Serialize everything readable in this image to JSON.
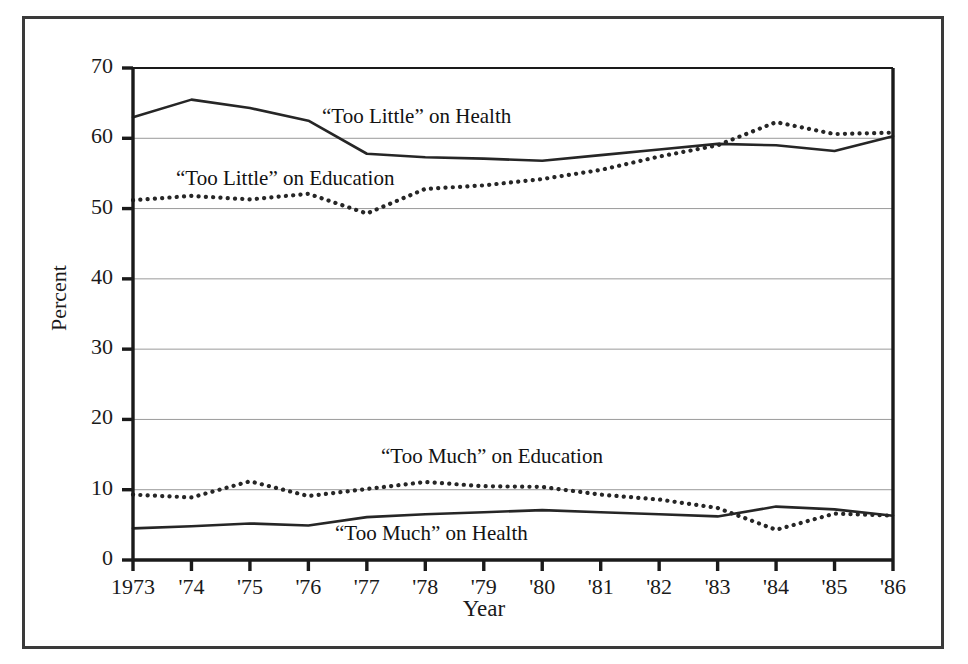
{
  "figure": {
    "background_color": "#ffffff",
    "frame_color": "#3a3a3a",
    "axis_color": "#1a1a1a",
    "gridline_color": "#9a9a9a",
    "series_color": "#262626"
  },
  "axes": {
    "x_title": "Year",
    "y_title": "Percent",
    "y_ticks": [
      "70",
      "60",
      "50",
      "40",
      "30",
      "20",
      "10",
      "0"
    ],
    "x_ticks": [
      "1973",
      "'74",
      "'75",
      "'76",
      "'77",
      "'78",
      "'79",
      "'80",
      "'81",
      "'82",
      "'83",
      "'84",
      "'85",
      "'86"
    ]
  },
  "annotations": {
    "too_little_health": "“Too Little” on Health",
    "too_little_education": "“Too Little” on Education",
    "too_much_education": "“Too Much” on Education",
    "too_much_health": "“Too Much” on Health"
  },
  "chart_data": {
    "type": "line",
    "title": "",
    "xlabel": "Year",
    "ylabel": "Percent",
    "xlim": [
      1973,
      1986
    ],
    "ylim": [
      0,
      70
    ],
    "ytick_step": 10,
    "grid": "horizontal",
    "legend": "inline-annotations",
    "x": [
      1973,
      1974,
      1975,
      1976,
      1977,
      1978,
      1979,
      1980,
      1981,
      1982,
      1983,
      1984,
      1985,
      1986
    ],
    "categories": [
      "1973",
      "'74",
      "'75",
      "'76",
      "'77",
      "'78",
      "'79",
      "'80",
      "'81",
      "'82",
      "'83",
      "'84",
      "'85",
      "'86"
    ],
    "series": [
      {
        "name": "“Too Little” on Health",
        "style": "solid",
        "values": [
          63.0,
          65.5,
          64.3,
          62.5,
          57.8,
          57.3,
          57.1,
          56.8,
          57.6,
          58.4,
          59.2,
          59.0,
          58.2,
          60.3
        ]
      },
      {
        "name": "“Too Little” on Education",
        "style": "dotted",
        "values": [
          51.2,
          51.8,
          51.3,
          52.1,
          49.3,
          52.8,
          53.3,
          54.2,
          55.5,
          57.4,
          59.0,
          62.3,
          60.6,
          60.8
        ]
      },
      {
        "name": "“Too Much” on Education",
        "style": "dotted",
        "values": [
          9.3,
          8.9,
          11.2,
          9.1,
          10.1,
          11.1,
          10.5,
          10.4,
          9.3,
          8.6,
          7.4,
          4.3,
          6.6,
          6.3
        ]
      },
      {
        "name": "“Too Much” on Health",
        "style": "solid",
        "values": [
          4.5,
          4.8,
          5.2,
          4.9,
          6.1,
          6.5,
          6.8,
          7.1,
          6.8,
          6.5,
          6.2,
          7.6,
          7.2,
          6.3
        ]
      }
    ]
  }
}
